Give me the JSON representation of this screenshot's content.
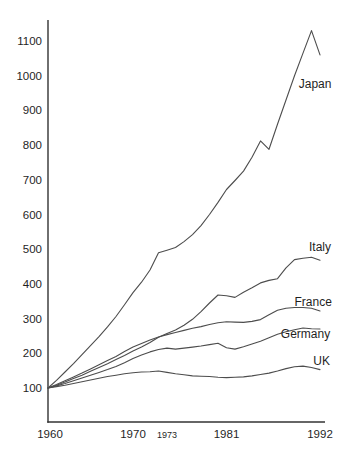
{
  "chart_data": {
    "type": "line",
    "title": "",
    "xlabel": "",
    "ylabel": "",
    "grid": false,
    "legend_position": "inline-labels-right",
    "xlim": [
      1960,
      1992
    ],
    "ylim": [
      100,
      1100
    ],
    "y_ticks": [
      100,
      200,
      300,
      400,
      500,
      600,
      700,
      800,
      900,
      1000,
      1100
    ],
    "x_ticks": [
      {
        "label": "1960",
        "year": 1960,
        "small": false
      },
      {
        "label": "1970",
        "year": 1970,
        "small": false
      },
      {
        "label": "1973",
        "year": 1973,
        "small": true
      },
      {
        "label": "1981",
        "year": 1981,
        "small": false
      },
      {
        "label": "1992",
        "year": 1992,
        "small": false
      }
    ],
    "series": [
      {
        "name": "Japan",
        "label_anchor": {
          "year": 1989.5,
          "value": 975,
          "align": "start"
        },
        "points": [
          [
            1960,
            100
          ],
          [
            1961,
            122
          ],
          [
            1962,
            146
          ],
          [
            1963,
            170
          ],
          [
            1964,
            196
          ],
          [
            1965,
            222
          ],
          [
            1966,
            248
          ],
          [
            1967,
            276
          ],
          [
            1968,
            306
          ],
          [
            1969,
            340
          ],
          [
            1970,
            375
          ],
          [
            1971,
            405
          ],
          [
            1972,
            440
          ],
          [
            1973,
            490
          ],
          [
            1974,
            497
          ],
          [
            1975,
            505
          ],
          [
            1976,
            522
          ],
          [
            1977,
            542
          ],
          [
            1978,
            568
          ],
          [
            1979,
            600
          ],
          [
            1980,
            635
          ],
          [
            1981,
            672
          ],
          [
            1982,
            698
          ],
          [
            1983,
            725
          ],
          [
            1984,
            765
          ],
          [
            1985,
            812
          ],
          [
            1986,
            788
          ],
          [
            1987,
            860
          ],
          [
            1988,
            930
          ],
          [
            1989,
            1000
          ],
          [
            1990,
            1065
          ],
          [
            1991,
            1130
          ],
          [
            1992,
            1060
          ]
        ]
      },
      {
        "name": "Italy",
        "label_anchor": {
          "year": 1992,
          "value": 505,
          "align": "middle"
        },
        "points": [
          [
            1960,
            100
          ],
          [
            1961,
            108
          ],
          [
            1962,
            117
          ],
          [
            1963,
            127
          ],
          [
            1964,
            137
          ],
          [
            1965,
            148
          ],
          [
            1966,
            159
          ],
          [
            1967,
            170
          ],
          [
            1968,
            182
          ],
          [
            1969,
            194
          ],
          [
            1970,
            207
          ],
          [
            1971,
            218
          ],
          [
            1972,
            231
          ],
          [
            1973,
            246
          ],
          [
            1974,
            257
          ],
          [
            1975,
            267
          ],
          [
            1976,
            281
          ],
          [
            1977,
            298
          ],
          [
            1978,
            320
          ],
          [
            1979,
            345
          ],
          [
            1980,
            368
          ],
          [
            1981,
            366
          ],
          [
            1982,
            361
          ],
          [
            1983,
            376
          ],
          [
            1984,
            389
          ],
          [
            1985,
            403
          ],
          [
            1986,
            410
          ],
          [
            1987,
            415
          ],
          [
            1988,
            446
          ],
          [
            1989,
            470
          ],
          [
            1990,
            474
          ],
          [
            1991,
            477
          ],
          [
            1992,
            468
          ]
        ]
      },
      {
        "name": "France",
        "label_anchor": {
          "year": 1991.2,
          "value": 347,
          "align": "middle"
        },
        "points": [
          [
            1960,
            100
          ],
          [
            1961,
            110
          ],
          [
            1962,
            121
          ],
          [
            1963,
            132
          ],
          [
            1964,
            143
          ],
          [
            1965,
            155
          ],
          [
            1966,
            167
          ],
          [
            1967,
            179
          ],
          [
            1968,
            191
          ],
          [
            1969,
            205
          ],
          [
            1970,
            218
          ],
          [
            1971,
            228
          ],
          [
            1972,
            238
          ],
          [
            1973,
            247
          ],
          [
            1974,
            254
          ],
          [
            1975,
            260
          ],
          [
            1976,
            266
          ],
          [
            1977,
            272
          ],
          [
            1978,
            277
          ],
          [
            1979,
            283
          ],
          [
            1980,
            288
          ],
          [
            1981,
            291
          ],
          [
            1982,
            290
          ],
          [
            1983,
            289
          ],
          [
            1984,
            292
          ],
          [
            1985,
            297
          ],
          [
            1986,
            311
          ],
          [
            1987,
            324
          ],
          [
            1988,
            330
          ],
          [
            1989,
            332
          ],
          [
            1990,
            332
          ],
          [
            1991,
            330
          ],
          [
            1992,
            322
          ]
        ]
      },
      {
        "name": "Germany",
        "label_anchor": {
          "year": 1990.3,
          "value": 256,
          "align": "middle"
        },
        "points": [
          [
            1960,
            100
          ],
          [
            1961,
            106
          ],
          [
            1962,
            113
          ],
          [
            1963,
            121
          ],
          [
            1964,
            129
          ],
          [
            1965,
            137
          ],
          [
            1966,
            145
          ],
          [
            1967,
            153
          ],
          [
            1968,
            162
          ],
          [
            1969,
            173
          ],
          [
            1970,
            185
          ],
          [
            1971,
            195
          ],
          [
            1972,
            204
          ],
          [
            1973,
            211
          ],
          [
            1974,
            215
          ],
          [
            1975,
            212
          ],
          [
            1976,
            215
          ],
          [
            1977,
            218
          ],
          [
            1978,
            221
          ],
          [
            1979,
            225
          ],
          [
            1980,
            229
          ],
          [
            1981,
            216
          ],
          [
            1982,
            212
          ],
          [
            1983,
            219
          ],
          [
            1984,
            227
          ],
          [
            1985,
            235
          ],
          [
            1986,
            245
          ],
          [
            1987,
            255
          ],
          [
            1988,
            262
          ],
          [
            1989,
            268
          ],
          [
            1990,
            273
          ],
          [
            1991,
            271
          ],
          [
            1992,
            270
          ]
        ]
      },
      {
        "name": "UK",
        "label_anchor": {
          "year": 1992.2,
          "value": 178,
          "align": "middle"
        },
        "points": [
          [
            1960,
            100
          ],
          [
            1961,
            104
          ],
          [
            1962,
            108
          ],
          [
            1963,
            113
          ],
          [
            1964,
            118
          ],
          [
            1965,
            123
          ],
          [
            1966,
            128
          ],
          [
            1967,
            133
          ],
          [
            1968,
            137
          ],
          [
            1969,
            141
          ],
          [
            1970,
            144
          ],
          [
            1971,
            146
          ],
          [
            1972,
            147
          ],
          [
            1973,
            149
          ],
          [
            1974,
            145
          ],
          [
            1975,
            141
          ],
          [
            1976,
            138
          ],
          [
            1977,
            135
          ],
          [
            1978,
            134
          ],
          [
            1979,
            133
          ],
          [
            1980,
            131
          ],
          [
            1981,
            130
          ],
          [
            1982,
            131
          ],
          [
            1983,
            132
          ],
          [
            1984,
            135
          ],
          [
            1985,
            139
          ],
          [
            1986,
            143
          ],
          [
            1987,
            149
          ],
          [
            1988,
            156
          ],
          [
            1989,
            161
          ],
          [
            1990,
            163
          ],
          [
            1991,
            159
          ],
          [
            1992,
            153
          ]
        ]
      }
    ]
  },
  "colors": {
    "background": "#ffffff",
    "curve": "#4d4d4d",
    "axis": "#333333",
    "text": "#1f1f1f"
  }
}
